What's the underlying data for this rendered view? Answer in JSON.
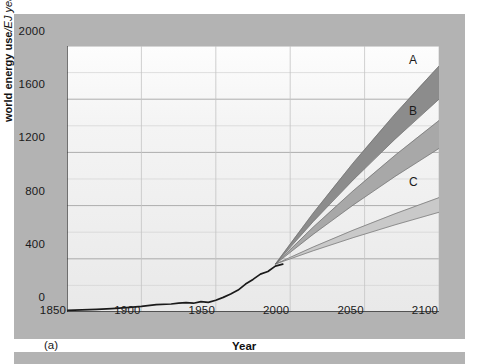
{
  "figure": {
    "panel_tag": "(a)",
    "background_color": "#b3b3b3",
    "plot_background_color": "#f2f2f2"
  },
  "chart_data": {
    "type": "line",
    "title": "",
    "xlabel": "Year",
    "ylabel": "world energy use/EJ year⁻¹",
    "ylabel_bold_part": "world energy use",
    "ylabel_italic_part": "/EJ year",
    "ylabel_superscript": "−1",
    "xlim": [
      1850,
      2100
    ],
    "ylim": [
      0,
      2000
    ],
    "xticks": [
      1850,
      1900,
      1950,
      2000,
      2050,
      2100
    ],
    "xtick_labels": [
      "1850",
      "1900",
      "1950",
      "2000",
      "2050",
      "2100"
    ],
    "yticks": [
      0,
      400,
      800,
      1200,
      1600,
      2000
    ],
    "ytick_labels": [
      "0",
      "400",
      "800",
      "1200",
      "1600",
      "2000"
    ],
    "gridlines": {
      "major_step": 400,
      "minor_step": 200,
      "visible": true
    },
    "legend": {
      "position": "inline-right-of-bands",
      "entries": [
        "A",
        "B",
        "C"
      ]
    },
    "historical": {
      "name": "historical world energy use",
      "color": "#1a1a1a",
      "x": [
        1850,
        1860,
        1870,
        1880,
        1890,
        1900,
        1910,
        1920,
        1925,
        1930,
        1935,
        1940,
        1945,
        1950,
        1955,
        1960,
        1965,
        1970,
        1975,
        1980,
        1985,
        1990,
        1995
      ],
      "y": [
        12,
        16,
        20,
        26,
        33,
        42,
        55,
        60,
        66,
        70,
        66,
        78,
        72,
        88,
        110,
        135,
        165,
        210,
        245,
        285,
        305,
        345,
        360
      ]
    },
    "series": [
      {
        "name": "A",
        "label": "A",
        "color": "#8c8c8c",
        "type": "band",
        "branch_year": 1990,
        "branch_value": 360,
        "end_year": 2100,
        "low_2100": 1600,
        "high_2100": 1850
      },
      {
        "name": "B",
        "label": "B",
        "color": "#a8a8a8",
        "type": "band",
        "branch_year": 1990,
        "branch_value": 360,
        "end_year": 2100,
        "low_2100": 1230,
        "high_2100": 1440
      },
      {
        "name": "C",
        "label": "C",
        "color": "#c9c9c9",
        "type": "band",
        "branch_year": 1990,
        "branch_value": 360,
        "end_year": 2100,
        "low_2100": 750,
        "high_2100": 860
      }
    ]
  }
}
